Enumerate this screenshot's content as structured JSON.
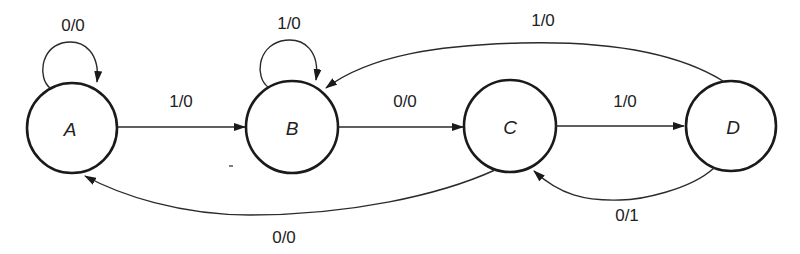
{
  "diagram": {
    "type": "state-transition-diagram",
    "states": [
      {
        "id": "A",
        "label": "A"
      },
      {
        "id": "B",
        "label": "B"
      },
      {
        "id": "C",
        "label": "C"
      },
      {
        "id": "D",
        "label": "D"
      }
    ],
    "transitions": [
      {
        "from": "A",
        "to": "A",
        "label": "0/0"
      },
      {
        "from": "A",
        "to": "B",
        "label": "1/0"
      },
      {
        "from": "B",
        "to": "B",
        "label": "1/0"
      },
      {
        "from": "B",
        "to": "C",
        "label": "0/0"
      },
      {
        "from": "C",
        "to": "D",
        "label": "1/0"
      },
      {
        "from": "D",
        "to": "B",
        "label": "1/0"
      },
      {
        "from": "D",
        "to": "C",
        "label": "0/1"
      },
      {
        "from": "C",
        "to": "A",
        "label": "0/0"
      }
    ]
  }
}
